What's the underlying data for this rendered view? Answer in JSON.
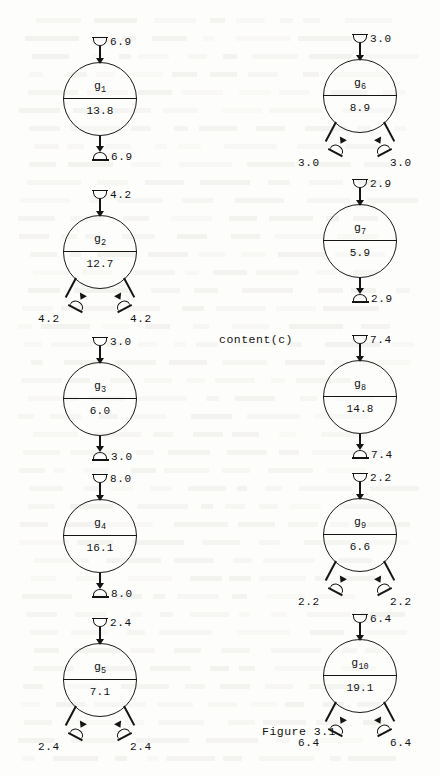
{
  "figure": {
    "caption": "Figure 3.1",
    "caption_x": 262,
    "caption_y": 726,
    "content_label": "content(c)",
    "content_label_x": 219,
    "content_label_y": 334
  },
  "columns": {
    "left_center_x": 100,
    "right_center_x": 360
  },
  "nodes": [
    {
      "id": "g1",
      "name": "g",
      "subscript": "1",
      "value": "13.8",
      "cx": 100,
      "cy": 99,
      "inflow": "6.9",
      "outlet_type": "single",
      "outflows": [
        "6.9"
      ]
    },
    {
      "id": "g2",
      "name": "g",
      "subscript": "2",
      "value": "12.7",
      "cx": 100,
      "cy": 252,
      "inflow": "4.2",
      "outlet_type": "double",
      "outflows": [
        "4.2",
        "4.2"
      ]
    },
    {
      "id": "g3",
      "name": "g",
      "subscript": "3",
      "value": "6.0",
      "cx": 100,
      "cy": 399,
      "inflow": "3.0",
      "outlet_type": "single",
      "outflows": [
        "3.0"
      ]
    },
    {
      "id": "g4",
      "name": "g",
      "subscript": "4",
      "value": "16.1",
      "cx": 100,
      "cy": 536,
      "inflow": "8.0",
      "outlet_type": "single",
      "outflows": [
        "8.0"
      ]
    },
    {
      "id": "g5",
      "name": "g",
      "subscript": "5",
      "value": "7.1",
      "cx": 100,
      "cy": 680,
      "inflow": "2.4",
      "outlet_type": "double",
      "outflows": [
        "2.4",
        "2.4"
      ]
    },
    {
      "id": "g6",
      "name": "g",
      "subscript": "6",
      "value": "8.9",
      "cx": 360,
      "cy": 96,
      "inflow": "3.0",
      "outlet_type": "double",
      "outflows": [
        "3.0",
        "3.0"
      ]
    },
    {
      "id": "g7",
      "name": "g",
      "subscript": "7",
      "value": "5.9",
      "cx": 360,
      "cy": 241,
      "inflow": "2.9",
      "outlet_type": "single",
      "outflows": [
        "2.9"
      ]
    },
    {
      "id": "g8",
      "name": "g",
      "subscript": "8",
      "value": "14.8",
      "cx": 360,
      "cy": 397,
      "inflow": "7.4",
      "outlet_type": "single",
      "outflows": [
        "7.4"
      ]
    },
    {
      "id": "g9",
      "name": "g",
      "subscript": "9",
      "value": "6.6",
      "cx": 360,
      "cy": 535,
      "inflow": "2.2",
      "outlet_type": "double",
      "outflows": [
        "2.2",
        "2.2"
      ]
    },
    {
      "id": "g10",
      "name": "g",
      "subscript": "10",
      "value": "19.1",
      "cx": 360,
      "cy": 676,
      "inflow": "6.4",
      "outlet_type": "double",
      "outflows": [
        "6.4",
        "6.4"
      ]
    }
  ],
  "colors": {
    "ink": "#141414",
    "paper": "#fdfdfb"
  }
}
